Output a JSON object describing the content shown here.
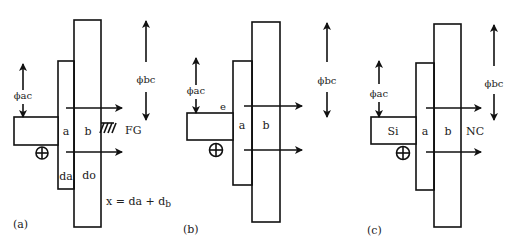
{
  "figure": {
    "panels": [
      {
        "id": "a",
        "caption": "(a)",
        "phi_ac": "ϕac",
        "phi_bc": "ϕbc",
        "region_a": "a",
        "region_b": "b",
        "left_region": "",
        "right_label": "FG",
        "lower_a": "da",
        "lower_b": "do",
        "equation": "x = da + d",
        "equation_sub": "b",
        "has_ground_hatch": true,
        "charge_symbol": "⊕"
      },
      {
        "id": "b",
        "caption": "(b)",
        "phi_ac": "ϕac",
        "phi_bc": "ϕbc",
        "region_a": "a",
        "region_b": "b",
        "top_label": "e",
        "charge_symbol": "⊕"
      },
      {
        "id": "c",
        "caption": "(c)",
        "phi_ac": "ϕac",
        "phi_bc": "ϕbc",
        "region_a": "a",
        "region_b": "b",
        "left_region": "Si",
        "right_label": "NC",
        "charge_symbol": "⊕"
      }
    ]
  }
}
